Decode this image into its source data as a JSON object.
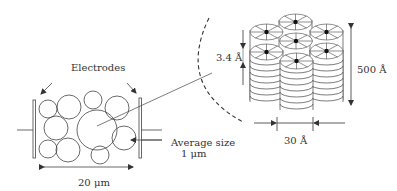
{
  "diagram": {
    "type": "schematic",
    "left_panel": {
      "electrodes_label": "Electrodes",
      "width_label": "20 μm",
      "average_size_label_line1": "Average size",
      "average_size_label_line2": "1 μm"
    },
    "right_panel": {
      "layer_spacing_label": "3.4 Å",
      "column_height_label": "500 Å",
      "column_width_label": "30 Å"
    },
    "colors": {
      "line": "#333333",
      "background": "#ffffff",
      "core": "#111111"
    }
  }
}
